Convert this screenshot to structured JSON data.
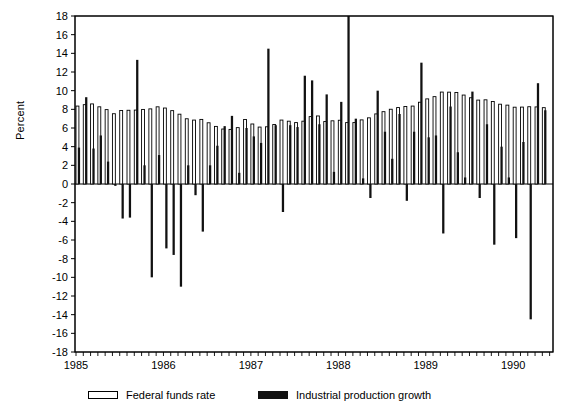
{
  "chart_data": {
    "type": "bar",
    "title": "",
    "subtitle": "",
    "xlabel": "",
    "ylabel": "Percent",
    "ylim": [
      -18,
      18
    ],
    "ytick_step": 2,
    "yticks": [
      18,
      16,
      14,
      12,
      10,
      8,
      6,
      4,
      2,
      0,
      -2,
      -4,
      -6,
      -8,
      -10,
      -12,
      -14,
      -16,
      -18
    ],
    "xlim": [
      "1985-01",
      "1990-05"
    ],
    "xticks": [
      "1985",
      "1986",
      "1987",
      "1988",
      "1989",
      "1990"
    ],
    "xtick_minor": "monthly",
    "grid": false,
    "legend_position": "bottom",
    "zero_line": true,
    "series": [
      {
        "name": "Federal funds rate",
        "style": "open-bar",
        "color": "#ffffff",
        "edge_color": "#000000",
        "values": [
          8.35,
          8.5,
          8.58,
          8.27,
          7.97,
          7.53,
          7.88,
          7.9,
          7.92,
          7.99,
          8.05,
          8.27,
          8.14,
          7.86,
          7.48,
          6.99,
          6.85,
          6.92,
          6.56,
          6.17,
          5.89,
          5.85,
          6.04,
          6.91,
          6.43,
          6.1,
          6.13,
          6.37,
          6.85,
          6.73,
          6.58,
          6.73,
          7.22,
          7.29,
          6.69,
          6.77,
          6.83,
          6.58,
          6.58,
          6.87,
          7.09,
          7.51,
          7.75,
          8.01,
          8.19,
          8.3,
          8.35,
          8.76,
          9.12,
          9.36,
          9.85,
          9.84,
          9.81,
          9.53,
          9.24,
          8.99,
          9.02,
          8.84,
          8.55,
          8.45,
          8.23,
          8.24,
          8.28,
          8.26,
          8.18
        ]
      },
      {
        "name": "Industrial production growth",
        "style": "solid-bar",
        "color": "#111111",
        "values": [
          3.9,
          9.3,
          3.8,
          5.2,
          2.4,
          -0.2,
          -3.7,
          -3.6,
          13.3,
          2.0,
          -10.0,
          3.1,
          -6.9,
          -7.6,
          -11.0,
          2.0,
          -1.2,
          -5.1,
          2.0,
          4.1,
          6.2,
          7.3,
          1.2,
          6.0,
          5.1,
          4.4,
          14.5,
          6.3,
          -3.0,
          6.3,
          6.1,
          11.6,
          11.1,
          6.4,
          9.6,
          1.3,
          8.8,
          18.0,
          7.0,
          0.6,
          -1.5,
          10.0,
          5.6,
          2.7,
          7.5,
          -1.8,
          5.6,
          13.0,
          5.0,
          5.2,
          -5.3,
          8.3,
          3.4,
          0.7,
          9.9,
          -1.5,
          6.4,
          -6.5,
          4.0,
          0.7,
          -5.8,
          4.5,
          -14.5,
          10.8,
          7.9
        ]
      }
    ]
  },
  "axes": {
    "ylabel": "Percent",
    "ytick_labels": [
      "18",
      "16",
      "14",
      "12",
      "10",
      "8",
      "6",
      "4",
      "2",
      "0",
      "-2",
      "-4",
      "-6",
      "-8",
      "-10",
      "-12",
      "-14",
      "-16",
      "-18"
    ],
    "xtick_labels": [
      "1985",
      "1986",
      "1987",
      "1988",
      "1989",
      "1990"
    ]
  },
  "legend": {
    "entries": [
      {
        "label": "Federal funds rate",
        "swatch": "open-bar"
      },
      {
        "label": "Industrial production growth",
        "swatch": "solid-bar"
      }
    ]
  },
  "colors": {
    "axis": "#000000",
    "open_bar_fill": "#ffffff",
    "open_bar_edge": "#000000",
    "solid_bar": "#111111",
    "background": "#ffffff"
  }
}
